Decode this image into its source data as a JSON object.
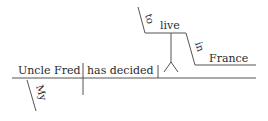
{
  "diagram": {
    "type": "sentence-diagram",
    "sentence": "My Uncle Fred has decided to live in France",
    "subject": "Uncle Fred",
    "subject_modifier": "My",
    "verb": "has decided",
    "object_infinitive": {
      "preposition": "to",
      "verb": "live",
      "prepositional_phrase": {
        "preposition": "in",
        "object": "France"
      }
    },
    "line_color": "#555555",
    "text_color": "#2a2a2a"
  }
}
